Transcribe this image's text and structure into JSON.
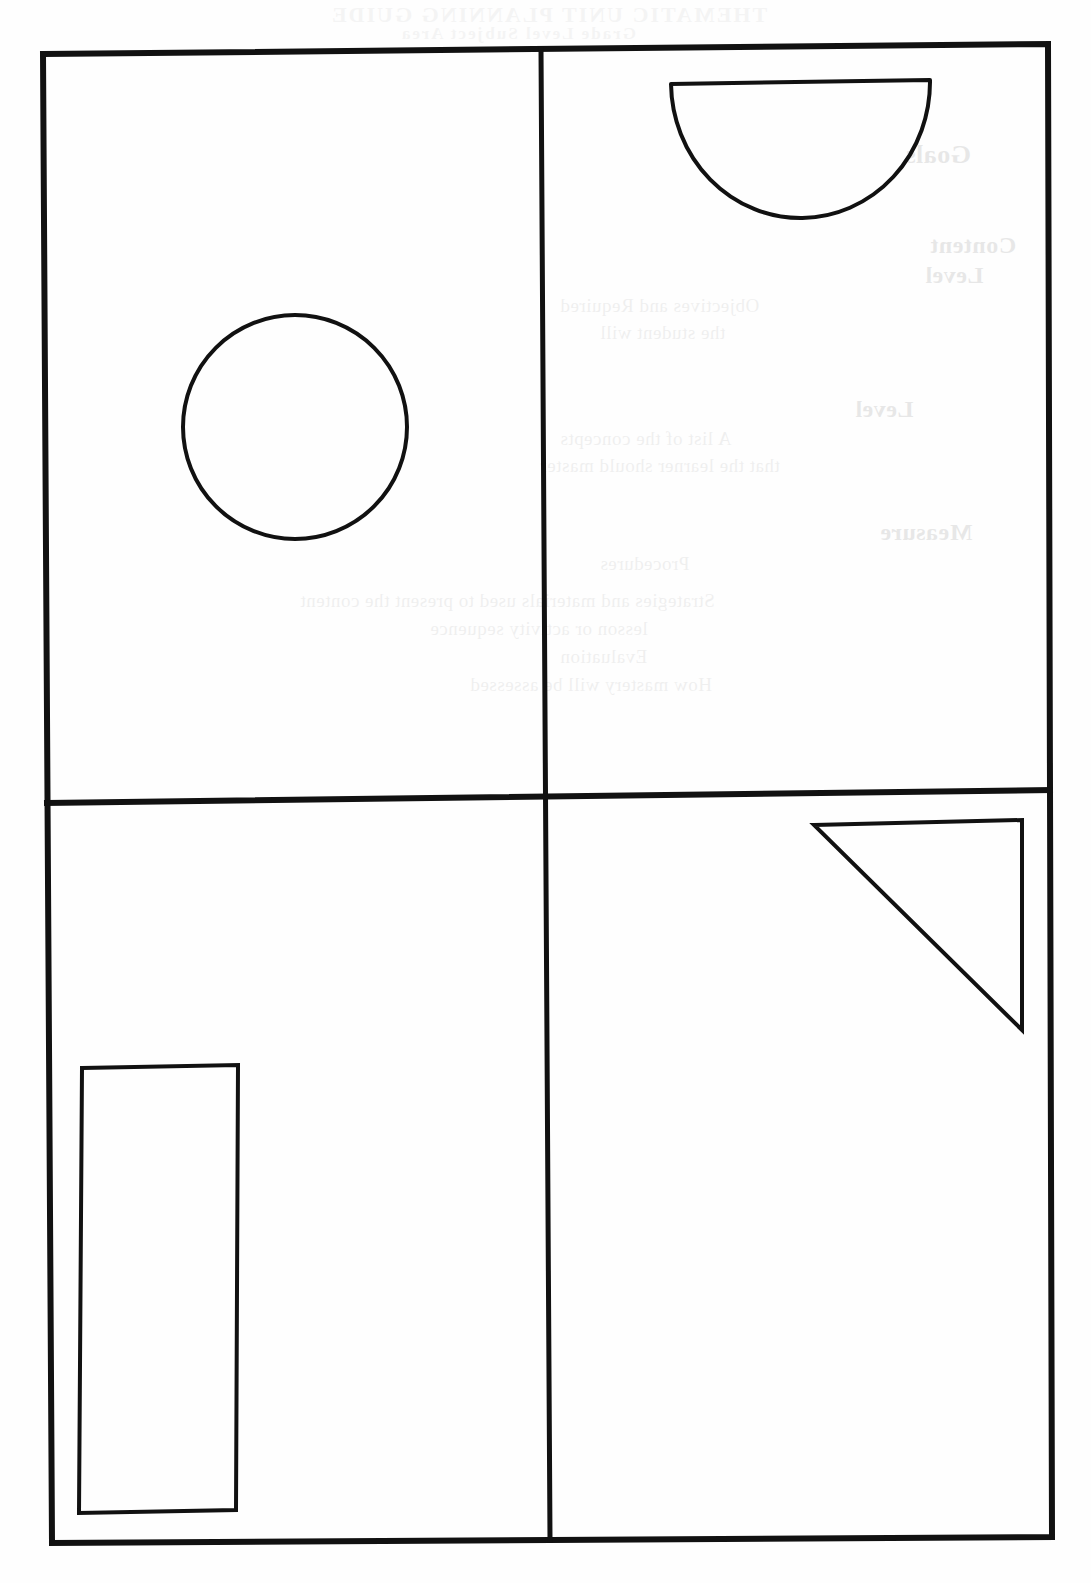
{
  "document": {
    "kind": "scanned-worksheet-page",
    "page_background": "#fefefe",
    "ink_color": "#111111",
    "width": 1091,
    "height": 1583
  },
  "page_frame": {
    "name": "outer-border",
    "description": "Hand-drawn rectangular border dividing the sheet into four quadrants",
    "corners": {
      "top_left": [
        43,
        54
      ],
      "top_right": [
        1048,
        44
      ],
      "bottom_right": [
        1052,
        1537
      ],
      "bottom_left": [
        52,
        1543
      ]
    },
    "stroke_width": 6
  },
  "dividers": [
    {
      "name": "vertical-divider",
      "orientation": "vertical",
      "from": [
        541,
        49
      ],
      "to": [
        550,
        1540
      ],
      "stroke_width": 5
    },
    {
      "name": "horizontal-divider",
      "orientation": "horizontal",
      "from": [
        47,
        803
      ],
      "to": [
        1050,
        790
      ],
      "stroke_width": 6
    }
  ],
  "quadrants": [
    {
      "id": "top-left",
      "label": "Quadrant 1",
      "shape": "circle"
    },
    {
      "id": "top-right",
      "label": "Quadrant 2",
      "shape": "semicircle"
    },
    {
      "id": "bottom-left",
      "label": "Quadrant 3",
      "shape": "rectangle"
    },
    {
      "id": "bottom-right",
      "label": "Quadrant 4",
      "shape": "triangle"
    }
  ],
  "shapes": [
    {
      "name": "circle",
      "quadrant": "top-left",
      "type": "circle",
      "center": [
        295,
        427
      ],
      "radius": 112,
      "stroke_width": 4,
      "fill": "none"
    },
    {
      "name": "semicircle",
      "quadrant": "top-right",
      "type": "semicircle",
      "orientation": "flat-edge-up",
      "flat_edge_left": [
        671,
        84
      ],
      "flat_edge_right": [
        930,
        80
      ],
      "bottom_point": [
        800,
        218
      ],
      "width": 259,
      "height": 136,
      "stroke_width": 4,
      "fill": "none"
    },
    {
      "name": "rectangle",
      "quadrant": "bottom-left",
      "type": "rectangle",
      "corners": {
        "top_left": [
          82,
          1068
        ],
        "top_right": [
          238,
          1065
        ],
        "bottom_right": [
          236,
          1510
        ],
        "bottom_left": [
          79,
          1513
        ]
      },
      "width": 156,
      "height": 445,
      "stroke_width": 4,
      "fill": "none"
    },
    {
      "name": "triangle",
      "quadrant": "bottom-right",
      "type": "right-triangle",
      "orientation": "right-angle-top-right",
      "vertices": [
        [
          814,
          825
        ],
        [
          1022,
          820
        ],
        [
          1022,
          1030
        ]
      ],
      "stroke_width": 4,
      "fill": "none"
    }
  ],
  "bleed_through": {
    "note": "Faint mirrored text showing through from the reverse side of the sheet",
    "header": "THEMATIC UNIT PLANNING GUIDE",
    "subheader": "Grade Level Subject Area",
    "lines": [
      {
        "text": "Goals",
        "x": 905,
        "y": 140,
        "size": 26,
        "bold": true
      },
      {
        "text": "Content",
        "x": 930,
        "y": 232,
        "size": 24,
        "bold": true
      },
      {
        "text": "Level",
        "x": 925,
        "y": 262,
        "size": 24,
        "bold": true
      },
      {
        "text": "Objectives and Required",
        "x": 560,
        "y": 295,
        "size": 19,
        "bold": false
      },
      {
        "text": "the student will",
        "x": 600,
        "y": 322,
        "size": 19,
        "bold": false
      },
      {
        "text": "Level",
        "x": 855,
        "y": 396,
        "size": 24,
        "bold": true
      },
      {
        "text": "A list of the concepts",
        "x": 560,
        "y": 428,
        "size": 19,
        "bold": false
      },
      {
        "text": "that the learner should master",
        "x": 540,
        "y": 455,
        "size": 19,
        "bold": false
      },
      {
        "text": "Measure",
        "x": 880,
        "y": 519,
        "size": 24,
        "bold": true
      },
      {
        "text": "Procedures",
        "x": 600,
        "y": 553,
        "size": 19,
        "bold": false
      },
      {
        "text": "Strategies and materials used to present the content",
        "x": 300,
        "y": 590,
        "size": 19,
        "bold": false
      },
      {
        "text": "lesson or activity sequence",
        "x": 430,
        "y": 618,
        "size": 19,
        "bold": false
      },
      {
        "text": "Evaluation",
        "x": 560,
        "y": 646,
        "size": 19,
        "bold": false
      },
      {
        "text": "How mastery will be assessed",
        "x": 470,
        "y": 674,
        "size": 19,
        "bold": false
      }
    ]
  }
}
